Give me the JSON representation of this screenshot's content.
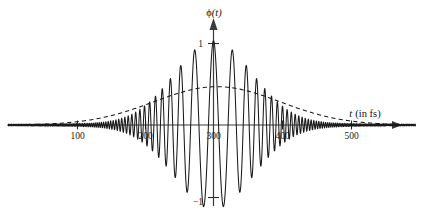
{
  "figure": {
    "name": "electric-field-wave-packet-plot",
    "background_color": "#ffffff",
    "stroke_color": "#1a1a1a",
    "axis_color": "#3a3a3a"
  },
  "chart_data": {
    "type": "line",
    "title": "",
    "xlabel": "t (in fs)",
    "ylabel": "ϕ(t)",
    "xlabel_parts": {
      "symbol": "t",
      "unit": "(in fs)"
    },
    "ylabel_parts": {
      "symbol": "ϕ",
      "arg": "(t)"
    },
    "xlim": [
      0,
      595
    ],
    "ylim": [
      -1.28,
      1.28
    ],
    "grid": false,
    "legend": false,
    "x_ticks": [
      100,
      200,
      300,
      400,
      500
    ],
    "x_tick_labels": [
      "100",
      "200",
      "300",
      "400",
      "500"
    ],
    "y_ticks": [
      1,
      -1
    ],
    "y_tick_labels": [
      "1",
      "−1"
    ],
    "axis_arrows": [
      "x-right",
      "y-up"
    ],
    "origin_value": 300,
    "series": [
      {
        "name": "phi(t) chirped pulse",
        "style": "solid",
        "description": "Oscillating wave packet, amplitude 1 at t = 300 fs, chirped frequency increasing away from center",
        "center_fs": 300,
        "peak_amplitude": 1.0,
        "envelope_sigma_fs": 57,
        "carrier_period_fs": 29.7,
        "chirp": 0.00019
      },
      {
        "name": "envelope (dashed)",
        "style": "dashed",
        "description": "Broad slowly varying dashed envelope peaking near 0.47 at t = 305 fs",
        "center_fs": 305,
        "peak_amplitude": 0.47,
        "sigma_fs": 92
      }
    ],
    "sampled_envelope": {
      "x": [
        0,
        25,
        50,
        75,
        100,
        125,
        150,
        175,
        200,
        225,
        250,
        275,
        300,
        325,
        350,
        375,
        400,
        425,
        450,
        475,
        500,
        525,
        550,
        575
      ],
      "y": [
        0.02,
        0.03,
        0.05,
        0.07,
        0.1,
        0.14,
        0.19,
        0.25,
        0.31,
        0.38,
        0.43,
        0.46,
        0.47,
        0.46,
        0.43,
        0.38,
        0.32,
        0.25,
        0.19,
        0.14,
        0.1,
        0.06,
        0.04,
        0.02
      ]
    },
    "sampled_peaks": {
      "t": [
        215,
        245,
        275,
        300,
        330,
        360,
        390
      ],
      "amplitude": [
        0.52,
        0.7,
        0.87,
        1.0,
        0.86,
        0.7,
        0.51
      ]
    }
  }
}
